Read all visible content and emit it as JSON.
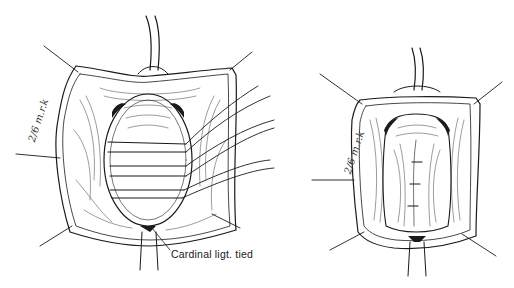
{
  "figure": {
    "panels": [
      {
        "id": "left",
        "description": "Vaginal wall opened with retractor sutures; multiple transverse sutures placed across the cervix/uterine stump; cardinal ligaments tied at the lower pole",
        "annotation": {
          "label": "Cardinal ligt. tied"
        },
        "signature": "2/6 m.r.k"
      },
      {
        "id": "right",
        "description": "Sutures tied, closing tissue in the midline; retractor sutures at corners",
        "signature": "2/6 m.r.k"
      }
    ],
    "colors": {
      "ink": "#1a1a1a",
      "background": "#ffffff"
    }
  }
}
